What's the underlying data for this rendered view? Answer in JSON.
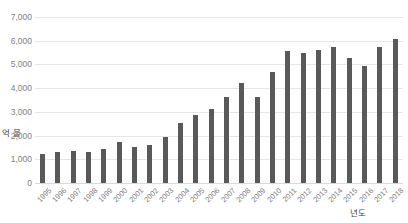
{
  "chart_data": {
    "type": "bar",
    "title": "",
    "subtitle": "",
    "xlabel": "년도",
    "ylabel": "억 불",
    "ylim": [
      0,
      7000
    ],
    "ytick_step": 1000,
    "ytick_labels": [
      "7,000",
      "6,000",
      "5,000",
      "4,000",
      "3,000",
      "2,000",
      "1,000",
      "0"
    ],
    "ytick_values": [
      7000,
      6000,
      5000,
      4000,
      3000,
      2000,
      1000,
      0
    ],
    "grid": true,
    "legend": null,
    "legend_position": "none",
    "bar_color": "#595959",
    "gridline_color": "#e6e6e6",
    "tick_text_color": "#808080",
    "axis_title_color": "#3f3f3f",
    "categories": [
      "1995",
      "1996",
      "1997",
      "1998",
      "1999",
      "2000",
      "2001",
      "2002",
      "2003",
      "2004",
      "2005",
      "2006",
      "2007",
      "2008",
      "2009",
      "2010",
      "2011",
      "2012",
      "2013",
      "2014",
      "2015",
      "2016",
      "2017",
      "2018"
    ],
    "values": [
      1230,
      1300,
      1370,
      1320,
      1420,
      1730,
      1500,
      1620,
      1950,
      2540,
      2850,
      3130,
      3620,
      4230,
      3640,
      4670,
      5550,
      5480,
      5600,
      5730,
      5270,
      4950,
      5740,
      6080
    ]
  }
}
